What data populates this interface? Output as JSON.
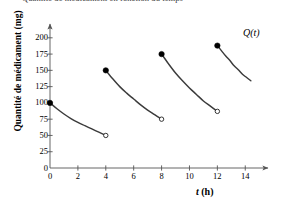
{
  "chart_data": {
    "type": "line",
    "title": "Quantité de médicament en fonction du temps",
    "xlabel_main": "t",
    "xlabel_unit": " (h)",
    "ylabel": "Quantité de médicament (mg)",
    "series_label": "Q(t)",
    "xlim": [
      0,
      15.2
    ],
    "ylim": [
      0,
      212
    ],
    "xticks": [
      0,
      2,
      4,
      6,
      8,
      10,
      12,
      14
    ],
    "xtick_labels": [
      "0",
      "2",
      "4",
      "6",
      "8",
      "10",
      "12",
      "14"
    ],
    "yticks": [
      0,
      25,
      50,
      75,
      100,
      125,
      150,
      175,
      200
    ],
    "ytick_labels": [
      "0",
      "25",
      "50",
      "75",
      "100",
      "125",
      "150",
      "175",
      "200"
    ],
    "grid": false,
    "legend_position": "inside-top-right",
    "line_color": "#3b3b3b",
    "axis_color": "#555555",
    "series": [
      {
        "name": "dose-1",
        "start_marker": "filled",
        "end_marker": "open",
        "x": [
          0,
          0.5,
          1,
          1.5,
          2,
          2.5,
          3,
          3.5,
          4
        ],
        "y": [
          100,
          91,
          83,
          76,
          70,
          65,
          60,
          55,
          50
        ]
      },
      {
        "name": "dose-2",
        "start_marker": "filled",
        "end_marker": "open",
        "x": [
          4,
          4.5,
          5,
          5.5,
          6,
          6.5,
          7,
          7.5,
          8
        ],
        "y": [
          150,
          137,
          125,
          115,
          106,
          97,
          89,
          82,
          75
        ]
      },
      {
        "name": "dose-3",
        "start_marker": "filled",
        "end_marker": "open",
        "x": [
          8,
          8.5,
          9,
          9.5,
          10,
          10.5,
          11,
          11.5,
          12
        ],
        "y": [
          175,
          160,
          146,
          134,
          123,
          113,
          103,
          95,
          87
        ]
      },
      {
        "name": "dose-4",
        "start_marker": "filled",
        "end_marker": "none",
        "x": [
          12,
          12.3,
          12.6,
          12.9,
          13.2,
          13.5,
          13.8,
          14.1,
          14.4
        ],
        "y": [
          188,
          180,
          172,
          165,
          157,
          151,
          144,
          139,
          134
        ]
      }
    ]
  }
}
